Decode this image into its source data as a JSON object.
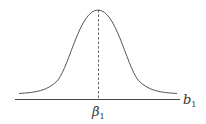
{
  "diagram": {
    "type": "normal-distribution-curve",
    "x_axis_label": "b",
    "x_axis_label_subscript": "1",
    "mean_label": "β",
    "mean_label_subscript": "1",
    "colors": {
      "curve": "#555555",
      "axis": "#444444",
      "dashed_line": "#555555",
      "text": "#333333"
    }
  }
}
